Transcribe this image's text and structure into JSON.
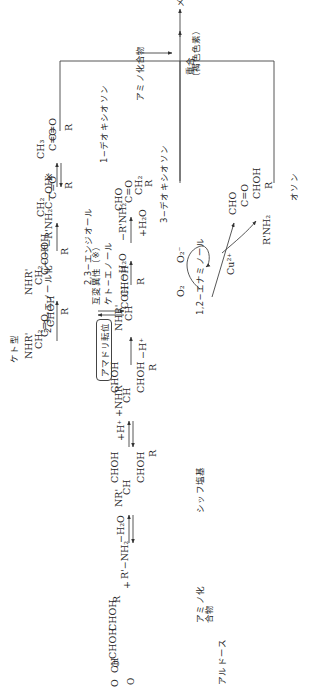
{
  "diagram": {
    "orientation": "rotated -90deg (text reads bottom-to-top)",
    "compounds": {
      "aldose": {
        "lines": [
          "O",
          "‖",
          "CH",
          "|",
          "CHOH",
          "|",
          "CHOH",
          "|",
          "R"
        ],
        "label": "アルドース"
      },
      "amino_compound": {
        "formula": "R'−NH₂",
        "label": "アミノ化合物",
        "plus": "+"
      },
      "schiff_base": {
        "lines": [
          "NR'",
          "‖",
          "CH",
          "|",
          "CHOH",
          "|",
          "CHOH",
          "|",
          "R"
        ],
        "label": "シッフ塩基"
      },
      "iminium": {
        "lines": [
          "+NHR'",
          "‖",
          "CH",
          "|",
          "CHOH",
          "|",
          "CHOH",
          "|",
          "R"
        ]
      },
      "enaminol_12": {
        "lines": [
          "NHR'",
          "|",
          "CH",
          "‖",
          "COH",
          "|",
          "CHOH",
          "|",
          "R"
        ],
        "label": "1,2−エナミノール"
      },
      "keto_form": {
        "lines": [
          "NHR'",
          "|",
          "CH₂",
          "|",
          "C=O",
          "|",
          "CHOH",
          "|",
          "R"
        ],
        "label": "ケト型"
      },
      "enediol_23": {
        "lines": [
          "NHR'",
          "|",
          "CH₂",
          "|",
          "C−OH",
          "‖",
          "C−OH",
          "|",
          "R"
        ],
        "label": "2,3−エンジオール"
      },
      "methyl_enol": {
        "lines": [
          "CH₂",
          "‖",
          "C−OH",
          "|",
          "C=O",
          "|",
          "R"
        ]
      },
      "deoxyosone_1": {
        "lines": [
          "CH₃",
          "|",
          "C=O",
          "|",
          "C=O",
          "|",
          "R"
        ],
        "label": "1−デオキシオソン"
      },
      "deoxyosone_3": {
        "lines": [
          "CHO",
          "|",
          "C=O",
          "|",
          "CH₂",
          "|",
          "R"
        ],
        "label": "3−デオキシオソン"
      },
      "osone": {
        "lines": [
          "CHO",
          "|",
          "C=O",
          "|",
          "CHOH",
          "|",
          "R"
        ],
        "label": "オソン"
      },
      "melanoidin": {
        "label": "メラノイジン",
        "sublabel": "（褐色色素）"
      }
    },
    "arrows": {
      "schiff_formation": "−H₂O",
      "protonation": "+H⁺",
      "deprotonation": "−H⁺",
      "amadori_box": "アマドリ転位",
      "keto_enol": "ケト−エノール",
      "tautomer": "互変異性（※）",
      "enolization_23": "2,3−エノール化",
      "amine_loss_1": "−R'NH₂",
      "star": "※",
      "dehydration_3": "−H₂O",
      "amine_loss_3": "−R'NH₂",
      "water_add_3": "+H₂O",
      "o2": "O₂",
      "superoxide": "O₂⁻",
      "copper": "Cu²⁺",
      "amine_release": "R'NH₂",
      "amino_input": "アミノ化合物",
      "polymerization": "重合"
    }
  }
}
